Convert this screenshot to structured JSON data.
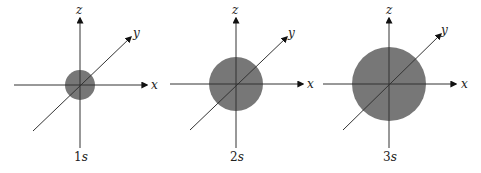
{
  "colors": {
    "axis": "#333333",
    "orbital_fill": "#777777",
    "background": "#ffffff"
  },
  "axes_labels": {
    "x": "x",
    "y": "y",
    "z": "z"
  },
  "panels": [
    {
      "name": "1s",
      "caption_number": "1",
      "caption_letter": "s",
      "center": [
        80,
        85
      ],
      "radius": 15,
      "x_axis": [
        14,
        147
      ],
      "z_axis": [
        18,
        148
      ],
      "y_axis": [
        [
          33,
          131
        ],
        [
          131,
          37
        ]
      ]
    },
    {
      "name": "2s",
      "caption_number": "2",
      "caption_letter": "s",
      "center": [
        236,
        84
      ],
      "radius": 27,
      "x_axis": [
        170,
        303
      ],
      "z_axis": [
        18,
        148
      ],
      "y_axis": [
        [
          190,
          130
        ],
        [
          287,
          37
        ]
      ]
    },
    {
      "name": "3s",
      "caption_number": "3",
      "caption_letter": "s",
      "center": [
        389,
        84
      ],
      "radius": 37,
      "x_axis": [
        323,
        456
      ],
      "z_axis": [
        18,
        148
      ],
      "y_axis": [
        [
          343,
          130
        ],
        [
          441,
          34
        ]
      ]
    }
  ]
}
